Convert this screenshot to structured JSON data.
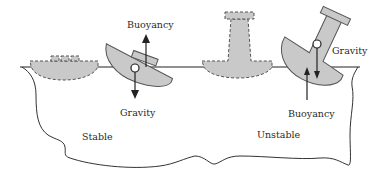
{
  "diagram": {
    "labels": {
      "stable_buoyancy": "Buoyancy",
      "stable_gravity": "Gravity",
      "stable_region": "Stable",
      "unstable_gravity": "Gravity",
      "unstable_buoyancy": "Buoyancy",
      "unstable_region": "Unstable"
    },
    "colors": {
      "hull_fill": "#c9c9c9",
      "line": "#222222",
      "background": "#ffffff"
    }
  }
}
